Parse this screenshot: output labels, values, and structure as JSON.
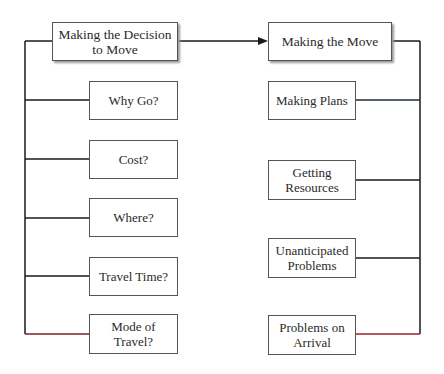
{
  "diagram": {
    "left": {
      "title": "Making the Decision to Move",
      "title_line1": "Making the Decision",
      "title_line2": "to Move",
      "items": [
        {
          "line1": "Why Go?",
          "line2": ""
        },
        {
          "line1": "Cost?",
          "line2": ""
        },
        {
          "line1": "Where?",
          "line2": ""
        },
        {
          "line1": "Travel Time?",
          "line2": ""
        },
        {
          "line1": "Mode of",
          "line2": "Travel?"
        }
      ]
    },
    "right": {
      "title": "Making the Move",
      "items": [
        {
          "line1": "Making Plans",
          "line2": ""
        },
        {
          "line1": "Getting",
          "line2": "Resources"
        },
        {
          "line1": "Unanticipated",
          "line2": "Problems"
        },
        {
          "line1": "Problems on",
          "line2": "Arrival"
        }
      ]
    },
    "colors": {
      "line": "#1a1a1a",
      "box_border": "#555555",
      "accent_line": "#8b1a1a"
    }
  }
}
